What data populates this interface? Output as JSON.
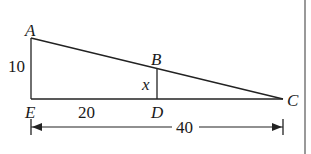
{
  "diagram": {
    "type": "geometry-similar-triangles",
    "points": {
      "A": {
        "label": "A"
      },
      "B": {
        "label": "B"
      },
      "C": {
        "label": "C"
      },
      "D": {
        "label": "D"
      },
      "E": {
        "label": "E"
      }
    },
    "measures": {
      "AE": "10",
      "ED": "20",
      "BD": "x",
      "EC": "40"
    },
    "colors": {
      "line": "#222222",
      "background": "#ffffff"
    }
  }
}
